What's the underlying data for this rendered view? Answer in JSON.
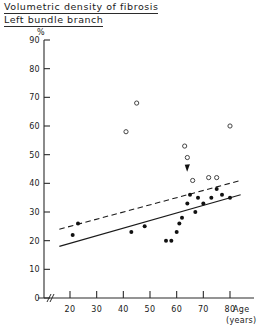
{
  "header": {
    "title": "Volumetric density of fibrosis",
    "subtitle": "Left bundle branch"
  },
  "chart_data": {
    "type": "scatter",
    "title": "Volumetric density of fibrosis",
    "subtitle": "Left bundle branch",
    "xlabel": "Age",
    "xlabel_unit": "(years)",
    "ylabel": "%",
    "xlim": [
      15,
      85
    ],
    "ylim": [
      0,
      90
    ],
    "xticks": [
      20,
      30,
      40,
      50,
      60,
      70,
      80
    ],
    "yticks": [
      0,
      10,
      20,
      30,
      40,
      50,
      60,
      70,
      80,
      90
    ],
    "grid": false,
    "legend": "none",
    "axis_break": true,
    "series": [
      {
        "name": "open-circles",
        "marker": "open circle",
        "points": [
          [
            45,
            68
          ],
          [
            41,
            58
          ],
          [
            63,
            53
          ],
          [
            64,
            49
          ],
          [
            72,
            42
          ],
          [
            80,
            60
          ],
          [
            66,
            41
          ],
          [
            75,
            42
          ]
        ]
      },
      {
        "name": "closed-circles",
        "marker": "filled circle",
        "points": [
          [
            23,
            26
          ],
          [
            21,
            22
          ],
          [
            43,
            23
          ],
          [
            48,
            25
          ],
          [
            56,
            20
          ],
          [
            58,
            20
          ],
          [
            60,
            23
          ],
          [
            62,
            28
          ],
          [
            64,
            33
          ],
          [
            65,
            36
          ],
          [
            67,
            30
          ],
          [
            68,
            35
          ],
          [
            70,
            33
          ],
          [
            73,
            35
          ],
          [
            75,
            38
          ],
          [
            77,
            36
          ],
          [
            80,
            35
          ],
          [
            61,
            26
          ]
        ]
      }
    ],
    "fit_lines": [
      {
        "name": "solid regression line",
        "style": "solid",
        "x0": 16,
        "y0": 18,
        "x1": 84,
        "y1": 36
      },
      {
        "name": "dashed regression line",
        "style": "dashed",
        "x0": 16,
        "y0": 24,
        "x1": 84,
        "y1": 41
      }
    ],
    "annotations": [
      {
        "name": "arrow-marker",
        "symbol": "downward arrow",
        "x": 64,
        "y": 44,
        "points_to": [
          64,
          40
        ]
      }
    ]
  }
}
